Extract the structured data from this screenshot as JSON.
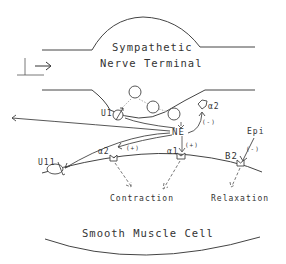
{
  "diagram": {
    "nerve_terminal": {
      "title_line1": "Sympathetic",
      "title_line2": "Nerve Terminal"
    },
    "smooth_muscle": {
      "title": "Smooth Muscle Cell"
    },
    "transmitter": {
      "vesicle_label": "NE",
      "released_label": "NE"
    },
    "receptors": {
      "prejunctional_uptake": "U1",
      "presynaptic_alpha2": "α2",
      "extraneuronal_uptake": "U11",
      "postjunctional_alpha2": "α2",
      "postjunctional_alpha1": "α1",
      "beta2": "B2"
    },
    "effects": {
      "alpha2_pre_effect": "(-)",
      "alpha2_post_effect": "(+)",
      "alpha1_effect": "(+)",
      "beta2_effect": "(-)"
    },
    "circulating": {
      "label": "Epi"
    },
    "outcomes": {
      "contraction": "Contraction",
      "relaxation": "Relaxation"
    },
    "stimulus": {
      "icon": "action-potential-arrow-icon"
    },
    "colors": {
      "line": "#444444",
      "dashed": "#555555",
      "text": "#333333"
    }
  }
}
